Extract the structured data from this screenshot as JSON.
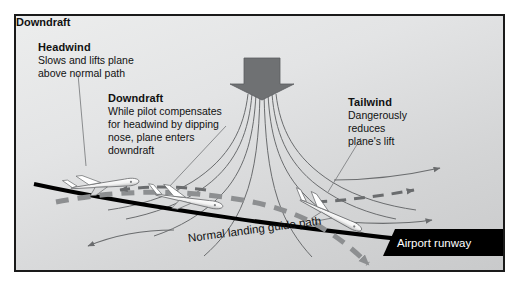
{
  "diagram": {
    "panel": {
      "background_color": "#e3e4e5",
      "border_color": "#1a1a1a"
    },
    "labels": {
      "headwind": {
        "heading": "Headwind",
        "body_lines": [
          "Slows and lifts plane",
          "above normal path"
        ]
      },
      "downdraft_body": {
        "heading": "Downdraft",
        "body_lines": [
          "While pilot compensates",
          "for headwind by dipping",
          "nose, plane enters",
          "downdraft"
        ]
      },
      "downdraft_title": {
        "heading": "Downdraft"
      },
      "tailwind": {
        "heading": "Tailwind",
        "body_lines": [
          "Dangerously",
          "reduces",
          "plane's lift"
        ]
      },
      "guide_path": "Normal landing guide path",
      "runway": "Airport runway"
    },
    "colors": {
      "downdraft_arrow": "#6f7173",
      "streamline": "#6a6c6e",
      "guide_path": "#000000",
      "flight_path": "#8d8f91",
      "wind_arrow": "#6a6c6e",
      "runway_fill": "#000000",
      "runway_text": "#ffffff",
      "text": "#111111"
    },
    "elements": {
      "downdraft_arrow": "down-block-arrow",
      "streamline_count": 8,
      "wind_arrow_left_direction": "left",
      "wind_arrow_right_direction": "right",
      "aircraft": [
        {
          "name": "plane-headwind",
          "attitude": "level-nose-up"
        },
        {
          "name": "plane-downdraft",
          "attitude": "nose-down"
        },
        {
          "name": "plane-tailwind",
          "attitude": "steep-nose-down"
        }
      ]
    }
  }
}
